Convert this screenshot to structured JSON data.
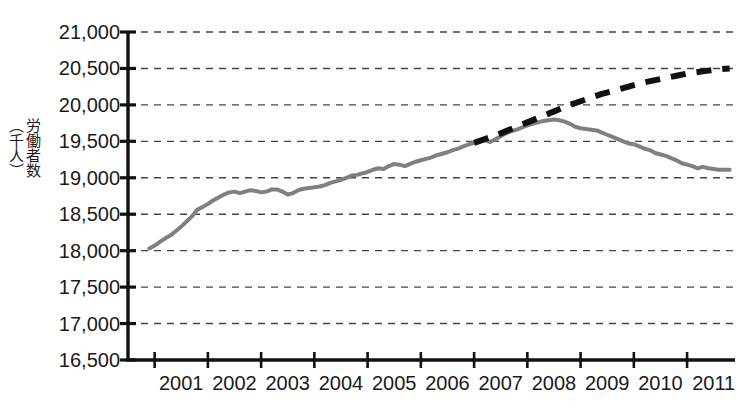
{
  "chart_data": {
    "type": "line",
    "title": "",
    "xlabel": "",
    "ylabel": "労働者数（千人）",
    "ylabel_chars": "労働者数\n（千人）",
    "ylim": [
      16500,
      21000
    ],
    "xlim": [
      2000.5,
      2011.9
    ],
    "grid": true,
    "grid_style": "dashed-horizontal",
    "legend": "none",
    "ytick_labels": [
      "21,000",
      "20,500",
      "20,000",
      "19,500",
      "19,000",
      "18,500",
      "18,000",
      "17,500",
      "17,000",
      "16,500"
    ],
    "ytick_values": [
      21000,
      20500,
      20000,
      19500,
      19000,
      18500,
      18000,
      17500,
      17000,
      16500
    ],
    "xtick_labels": [
      "2001",
      "2002",
      "2003",
      "2004",
      "2005",
      "2006",
      "2007",
      "2008",
      "2009",
      "2010",
      "2011"
    ],
    "xtick_values": [
      2001,
      2002,
      2003,
      2004,
      2005,
      2006,
      2007,
      2008,
      2009,
      2010,
      2011
    ],
    "series": [
      {
        "name": "actual",
        "style": "solid",
        "color": "#808080",
        "width": 4,
        "points": [
          [
            2000.9,
            18030
          ],
          [
            2001.0,
            18070
          ],
          [
            2001.1,
            18120
          ],
          [
            2001.2,
            18170
          ],
          [
            2001.3,
            18210
          ],
          [
            2001.4,
            18270
          ],
          [
            2001.5,
            18330
          ],
          [
            2001.6,
            18400
          ],
          [
            2001.7,
            18470
          ],
          [
            2001.8,
            18560
          ],
          [
            2001.9,
            18600
          ],
          [
            2002.0,
            18640
          ],
          [
            2002.1,
            18690
          ],
          [
            2002.2,
            18730
          ],
          [
            2002.3,
            18770
          ],
          [
            2002.4,
            18800
          ],
          [
            2002.5,
            18810
          ],
          [
            2002.6,
            18790
          ],
          [
            2002.7,
            18810
          ],
          [
            2002.8,
            18830
          ],
          [
            2002.9,
            18820
          ],
          [
            2003.0,
            18800
          ],
          [
            2003.1,
            18810
          ],
          [
            2003.2,
            18840
          ],
          [
            2003.3,
            18840
          ],
          [
            2003.4,
            18810
          ],
          [
            2003.5,
            18770
          ],
          [
            2003.6,
            18790
          ],
          [
            2003.7,
            18830
          ],
          [
            2003.8,
            18850
          ],
          [
            2003.9,
            18860
          ],
          [
            2004.0,
            18870
          ],
          [
            2004.1,
            18880
          ],
          [
            2004.2,
            18900
          ],
          [
            2004.3,
            18930
          ],
          [
            2004.4,
            18950
          ],
          [
            2004.5,
            18970
          ],
          [
            2004.6,
            19000
          ],
          [
            2004.7,
            19030
          ],
          [
            2004.8,
            19040
          ],
          [
            2004.9,
            19060
          ],
          [
            2005.0,
            19080
          ],
          [
            2005.1,
            19110
          ],
          [
            2005.2,
            19130
          ],
          [
            2005.3,
            19120
          ],
          [
            2005.4,
            19160
          ],
          [
            2005.5,
            19190
          ],
          [
            2005.6,
            19180
          ],
          [
            2005.7,
            19160
          ],
          [
            2005.8,
            19190
          ],
          [
            2005.9,
            19220
          ],
          [
            2006.0,
            19240
          ],
          [
            2006.1,
            19260
          ],
          [
            2006.2,
            19280
          ],
          [
            2006.3,
            19310
          ],
          [
            2006.4,
            19330
          ],
          [
            2006.5,
            19350
          ],
          [
            2006.6,
            19380
          ],
          [
            2006.7,
            19400
          ],
          [
            2006.8,
            19430
          ],
          [
            2006.9,
            19460
          ],
          [
            2007.0,
            19480
          ],
          [
            2007.1,
            19500
          ],
          [
            2007.2,
            19520
          ],
          [
            2007.3,
            19490
          ],
          [
            2007.4,
            19530
          ],
          [
            2007.5,
            19570
          ],
          [
            2007.6,
            19610
          ],
          [
            2007.7,
            19640
          ],
          [
            2007.8,
            19660
          ],
          [
            2007.9,
            19690
          ],
          [
            2008.0,
            19720
          ],
          [
            2008.1,
            19740
          ],
          [
            2008.2,
            19760
          ],
          [
            2008.3,
            19780
          ],
          [
            2008.4,
            19790
          ],
          [
            2008.5,
            19800
          ],
          [
            2008.6,
            19790
          ],
          [
            2008.7,
            19770
          ],
          [
            2008.8,
            19740
          ],
          [
            2008.9,
            19700
          ],
          [
            2009.0,
            19680
          ],
          [
            2009.1,
            19670
          ],
          [
            2009.2,
            19660
          ],
          [
            2009.3,
            19650
          ],
          [
            2009.4,
            19620
          ],
          [
            2009.5,
            19590
          ],
          [
            2009.6,
            19560
          ],
          [
            2009.7,
            19530
          ],
          [
            2009.8,
            19500
          ],
          [
            2009.9,
            19470
          ],
          [
            2010.0,
            19460
          ],
          [
            2010.1,
            19430
          ],
          [
            2010.2,
            19400
          ],
          [
            2010.3,
            19380
          ],
          [
            2010.4,
            19340
          ],
          [
            2010.5,
            19320
          ],
          [
            2010.6,
            19300
          ],
          [
            2010.7,
            19270
          ],
          [
            2010.8,
            19240
          ],
          [
            2010.9,
            19200
          ],
          [
            2011.0,
            19180
          ],
          [
            2011.1,
            19160
          ],
          [
            2011.2,
            19130
          ],
          [
            2011.3,
            19150
          ],
          [
            2011.4,
            19130
          ],
          [
            2011.5,
            19120
          ],
          [
            2011.6,
            19110
          ],
          [
            2011.7,
            19110
          ],
          [
            2011.8,
            19110
          ]
        ]
      },
      {
        "name": "projection",
        "style": "dashed",
        "color": "#111111",
        "width": 6,
        "dash": "15,11",
        "points": [
          [
            2007.0,
            19480
          ],
          [
            2007.2,
            19530
          ],
          [
            2007.4,
            19580
          ],
          [
            2007.6,
            19640
          ],
          [
            2007.8,
            19700
          ],
          [
            2008.0,
            19760
          ],
          [
            2008.2,
            19820
          ],
          [
            2008.4,
            19880
          ],
          [
            2008.6,
            19940
          ],
          [
            2008.8,
            20000
          ],
          [
            2009.0,
            20050
          ],
          [
            2009.2,
            20100
          ],
          [
            2009.4,
            20150
          ],
          [
            2009.6,
            20190
          ],
          [
            2009.8,
            20230
          ],
          [
            2010.0,
            20270
          ],
          [
            2010.2,
            20310
          ],
          [
            2010.4,
            20340
          ],
          [
            2010.6,
            20370
          ],
          [
            2010.8,
            20400
          ],
          [
            2011.0,
            20430
          ],
          [
            2011.2,
            20450
          ],
          [
            2011.4,
            20470
          ],
          [
            2011.6,
            20490
          ],
          [
            2011.8,
            20500
          ]
        ]
      }
    ]
  },
  "axes_geometry": {
    "plot_left": 128,
    "plot_right": 735,
    "plot_top": 32,
    "plot_bottom": 360
  }
}
